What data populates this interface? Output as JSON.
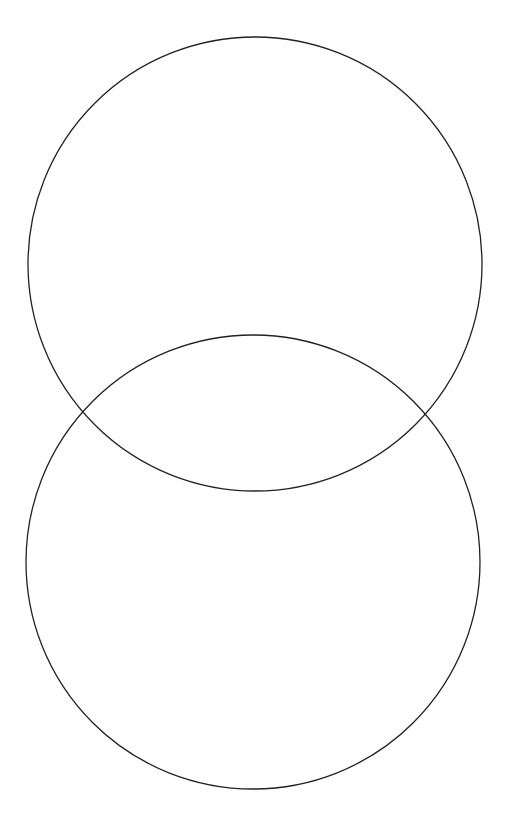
{
  "diagram": {
    "type": "two-overlapping-circles",
    "width": 515,
    "height": 821,
    "background": "#ffffff",
    "stroke_color": "#222222",
    "stroke_width": 1.3,
    "circles": [
      {
        "id": "top-circle",
        "cx": 255,
        "cy": 264,
        "r": 227
      },
      {
        "id": "bottom-circle",
        "cx": 253,
        "cy": 562,
        "r": 227
      }
    ]
  }
}
